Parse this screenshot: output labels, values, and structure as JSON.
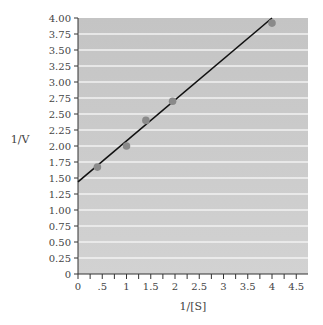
{
  "chart_data": {
    "type": "scatter",
    "title": "",
    "xlabel": "1/[S]",
    "ylabel": "1/V",
    "xlim": [
      0,
      4.6
    ],
    "ylim": [
      0,
      4.0
    ],
    "x_ticks": [
      "0",
      ".5",
      "1",
      "1.5",
      "2",
      "2.5",
      "3",
      "3.5",
      "4",
      "4.5"
    ],
    "x_tick_values": [
      0,
      0.5,
      1,
      1.5,
      2,
      2.5,
      3,
      3.5,
      4,
      4.5
    ],
    "y_ticks": [
      "0",
      "0.25",
      "0.50",
      "0.75",
      "1.00",
      "1.25",
      "1.50",
      "1.75",
      "2.00",
      "2.25",
      "2.50",
      "2.75",
      "3.00",
      "3.25",
      "3.50",
      "3.75",
      "4.00"
    ],
    "y_tick_values": [
      0,
      0.25,
      0.5,
      0.75,
      1,
      1.25,
      1.5,
      1.75,
      2,
      2.25,
      2.5,
      2.75,
      3,
      3.25,
      3.5,
      3.75,
      4
    ],
    "grid": "horizontal",
    "series": [
      {
        "name": "data points",
        "type": "scatter",
        "x": [
          0.4,
          1.0,
          1.4,
          1.95,
          4.0
        ],
        "y": [
          1.67,
          2.0,
          2.4,
          2.7,
          3.92
        ]
      },
      {
        "name": "linear fit",
        "type": "line",
        "x": [
          0,
          4.0
        ],
        "y": [
          1.44,
          4.0
        ]
      }
    ],
    "colors": {
      "plot_background": "#c8c8c8",
      "grid": "#f2f2f2",
      "points": "#8a8a8a",
      "line": "#111111"
    }
  }
}
